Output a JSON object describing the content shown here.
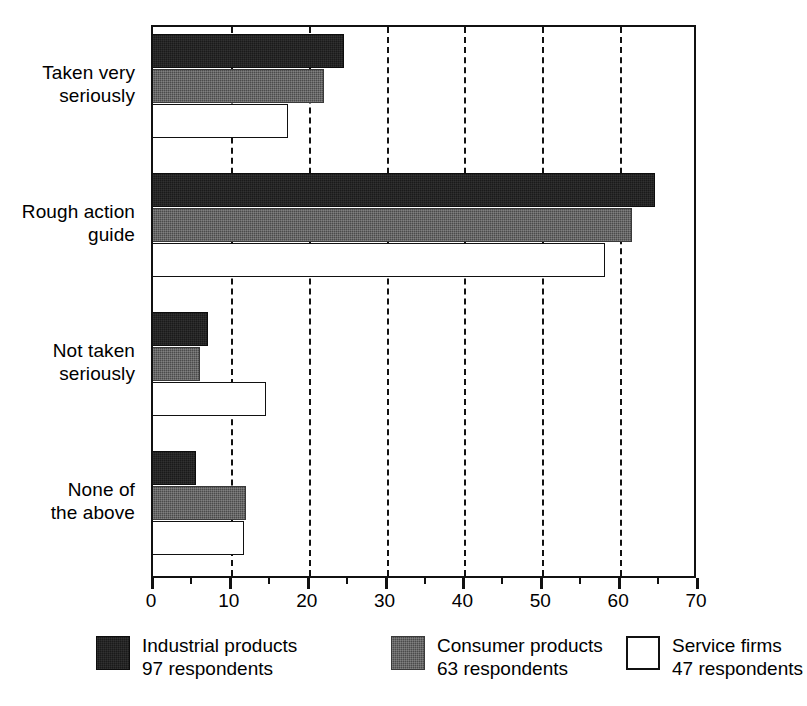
{
  "chart_data": {
    "type": "bar",
    "orientation": "horizontal",
    "title": "",
    "subtitle": "",
    "xlabel": "",
    "ylabel": "",
    "xlim": [
      0,
      70
    ],
    "grid": true,
    "grid_axis": "x",
    "legend_position": "bottom",
    "categories": [
      "Taken very\nseriously",
      "Rough action\nguide",
      "Not taken\nseriously",
      "None of\nthe above"
    ],
    "xticks": [
      0,
      10,
      20,
      30,
      40,
      50,
      60,
      70
    ],
    "xtick_labels": [
      "0",
      "10",
      "20",
      "30",
      "40",
      "50",
      "60",
      "70"
    ],
    "xminor_ticks": [
      5,
      15,
      25,
      35,
      45,
      55,
      65
    ],
    "series": [
      {
        "name": "Industrial products",
        "respondents": "97 respondents",
        "color": "#1a1a1a",
        "values": [
          24.5,
          64.5,
          7.0,
          5.5
        ]
      },
      {
        "name": "Consumer products",
        "respondents": "63 respondents",
        "color": "#4b4b4b",
        "values": [
          22.0,
          61.5,
          6.0,
          12.0
        ]
      },
      {
        "name": "Service firms",
        "respondents": "47 respondents",
        "color": "#ffffff",
        "values": [
          17.3,
          58.0,
          14.5,
          11.7
        ]
      }
    ]
  },
  "legend": {
    "items": [
      {
        "label": "Industrial products",
        "sub": "97 respondents",
        "swatch": "industrial"
      },
      {
        "label": "Consumer products",
        "sub": "63 respondents",
        "swatch": "consumer"
      },
      {
        "label": "Service firms",
        "sub": "47 respondents",
        "swatch": "service"
      }
    ]
  }
}
